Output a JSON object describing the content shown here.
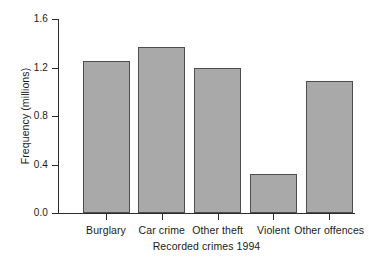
{
  "chart_data": {
    "type": "bar",
    "title": "",
    "xlabel": "Recorded crimes 1994",
    "ylabel": "Frequency (millions)",
    "categories": [
      "Burglary",
      "Car crime",
      "Other theft",
      "Violent",
      "Other offences"
    ],
    "values": [
      1.25,
      1.37,
      1.2,
      0.32,
      1.09
    ],
    "ylim": [
      0.0,
      1.6
    ],
    "yticks": [
      "0.0",
      "0.4",
      "0.8",
      "1.2",
      "1.6"
    ],
    "ytick_values": [
      0.0,
      0.4,
      0.8,
      1.2,
      1.6
    ],
    "grid": false,
    "legend": null,
    "bar_color": "#a9a9a9",
    "bar_edge_color": "#4d4d4d",
    "axis_color": "#2b2b2b",
    "background": "#ffffff"
  }
}
